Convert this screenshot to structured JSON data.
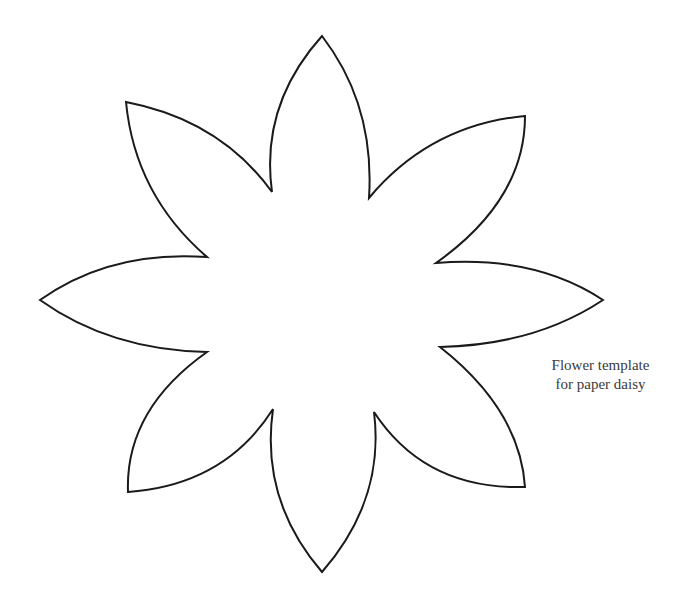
{
  "caption": {
    "line1": "Flower template",
    "line2": "for paper daisy"
  },
  "flower": {
    "petal_count": 8,
    "stroke_color": "#1a1a1a",
    "fill_color": "#ffffff"
  }
}
